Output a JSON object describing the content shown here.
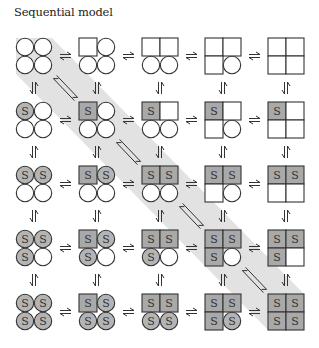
{
  "title": "Sequential model",
  "colors": {
    "band": "#e2e2e2",
    "box_bound": "#a9a9a9",
    "circle_bound": "#b4b4b4",
    "empty": "#ffffff",
    "stroke": "#333333"
  },
  "grid": {
    "cols": 5,
    "rows": 5,
    "origin_x": 16,
    "origin_y": 38,
    "step_x": 63,
    "step_y": 64,
    "cell": 36
  },
  "subunit_label": "S",
  "legend_note": "Each molecule: 4 subunits (TL, TR, BL, BR). Shape: circle = T state, square = R state. S = substrate bound.",
  "molecules": [
    {
      "row": 0,
      "col": 0,
      "shapes": [
        "c",
        "c",
        "c",
        "c"
      ],
      "bound": [
        0,
        0,
        0,
        0
      ]
    },
    {
      "row": 0,
      "col": 1,
      "shapes": [
        "s",
        "c",
        "c",
        "c"
      ],
      "bound": [
        0,
        0,
        0,
        0
      ]
    },
    {
      "row": 0,
      "col": 2,
      "shapes": [
        "s",
        "s",
        "c",
        "c"
      ],
      "bound": [
        0,
        0,
        0,
        0
      ]
    },
    {
      "row": 0,
      "col": 3,
      "shapes": [
        "s",
        "s",
        "s",
        "c"
      ],
      "bound": [
        0,
        0,
        0,
        0
      ]
    },
    {
      "row": 0,
      "col": 4,
      "shapes": [
        "s",
        "s",
        "s",
        "s"
      ],
      "bound": [
        0,
        0,
        0,
        0
      ]
    },
    {
      "row": 1,
      "col": 0,
      "shapes": [
        "c",
        "c",
        "c",
        "c"
      ],
      "bound": [
        1,
        0,
        0,
        0
      ]
    },
    {
      "row": 1,
      "col": 1,
      "shapes": [
        "s",
        "c",
        "c",
        "c"
      ],
      "bound": [
        1,
        0,
        0,
        0
      ]
    },
    {
      "row": 1,
      "col": 2,
      "shapes": [
        "s",
        "s",
        "c",
        "c"
      ],
      "bound": [
        1,
        0,
        0,
        0
      ]
    },
    {
      "row": 1,
      "col": 3,
      "shapes": [
        "s",
        "s",
        "s",
        "c"
      ],
      "bound": [
        1,
        0,
        0,
        0
      ]
    },
    {
      "row": 1,
      "col": 4,
      "shapes": [
        "s",
        "s",
        "s",
        "s"
      ],
      "bound": [
        1,
        0,
        0,
        0
      ]
    },
    {
      "row": 2,
      "col": 0,
      "shapes": [
        "c",
        "c",
        "c",
        "c"
      ],
      "bound": [
        1,
        1,
        0,
        0
      ]
    },
    {
      "row": 2,
      "col": 1,
      "shapes": [
        "s",
        "c",
        "c",
        "c"
      ],
      "bound": [
        1,
        1,
        0,
        0
      ]
    },
    {
      "row": 2,
      "col": 2,
      "shapes": [
        "s",
        "s",
        "c",
        "c"
      ],
      "bound": [
        1,
        1,
        0,
        0
      ]
    },
    {
      "row": 2,
      "col": 3,
      "shapes": [
        "s",
        "s",
        "s",
        "c"
      ],
      "bound": [
        1,
        1,
        0,
        0
      ]
    },
    {
      "row": 2,
      "col": 4,
      "shapes": [
        "s",
        "s",
        "s",
        "s"
      ],
      "bound": [
        1,
        1,
        0,
        0
      ]
    },
    {
      "row": 3,
      "col": 0,
      "shapes": [
        "c",
        "c",
        "c",
        "c"
      ],
      "bound": [
        1,
        1,
        1,
        0
      ]
    },
    {
      "row": 3,
      "col": 1,
      "shapes": [
        "s",
        "c",
        "c",
        "c"
      ],
      "bound": [
        1,
        1,
        1,
        0
      ]
    },
    {
      "row": 3,
      "col": 2,
      "shapes": [
        "s",
        "s",
        "c",
        "c"
      ],
      "bound": [
        1,
        1,
        1,
        0
      ]
    },
    {
      "row": 3,
      "col": 3,
      "shapes": [
        "s",
        "s",
        "s",
        "c"
      ],
      "bound": [
        1,
        1,
        1,
        0
      ]
    },
    {
      "row": 3,
      "col": 4,
      "shapes": [
        "s",
        "s",
        "s",
        "s"
      ],
      "bound": [
        1,
        1,
        1,
        0
      ]
    },
    {
      "row": 4,
      "col": 0,
      "shapes": [
        "c",
        "c",
        "c",
        "c"
      ],
      "bound": [
        1,
        1,
        1,
        1
      ]
    },
    {
      "row": 4,
      "col": 1,
      "shapes": [
        "s",
        "c",
        "c",
        "c"
      ],
      "bound": [
        1,
        1,
        1,
        1
      ]
    },
    {
      "row": 4,
      "col": 2,
      "shapes": [
        "s",
        "s",
        "c",
        "c"
      ],
      "bound": [
        1,
        1,
        1,
        1
      ]
    },
    {
      "row": 4,
      "col": 3,
      "shapes": [
        "s",
        "s",
        "s",
        "c"
      ],
      "bound": [
        1,
        1,
        1,
        1
      ]
    },
    {
      "row": 4,
      "col": 4,
      "shapes": [
        "s",
        "s",
        "s",
        "s"
      ],
      "bound": [
        1,
        1,
        1,
        1
      ]
    }
  ],
  "band_diagonal": [
    [
      0,
      0
    ],
    [
      1,
      1
    ],
    [
      2,
      2
    ],
    [
      3,
      3
    ],
    [
      4,
      4
    ]
  ],
  "arrows": {
    "horizontal": "equilibrium between every adjacent column in each row",
    "vertical": "equilibrium between every adjacent row in each column",
    "diagonal": [
      [
        0,
        0,
        1,
        1
      ],
      [
        1,
        1,
        2,
        2
      ],
      [
        2,
        2,
        3,
        3
      ],
      [
        3,
        3,
        4,
        4
      ]
    ]
  }
}
